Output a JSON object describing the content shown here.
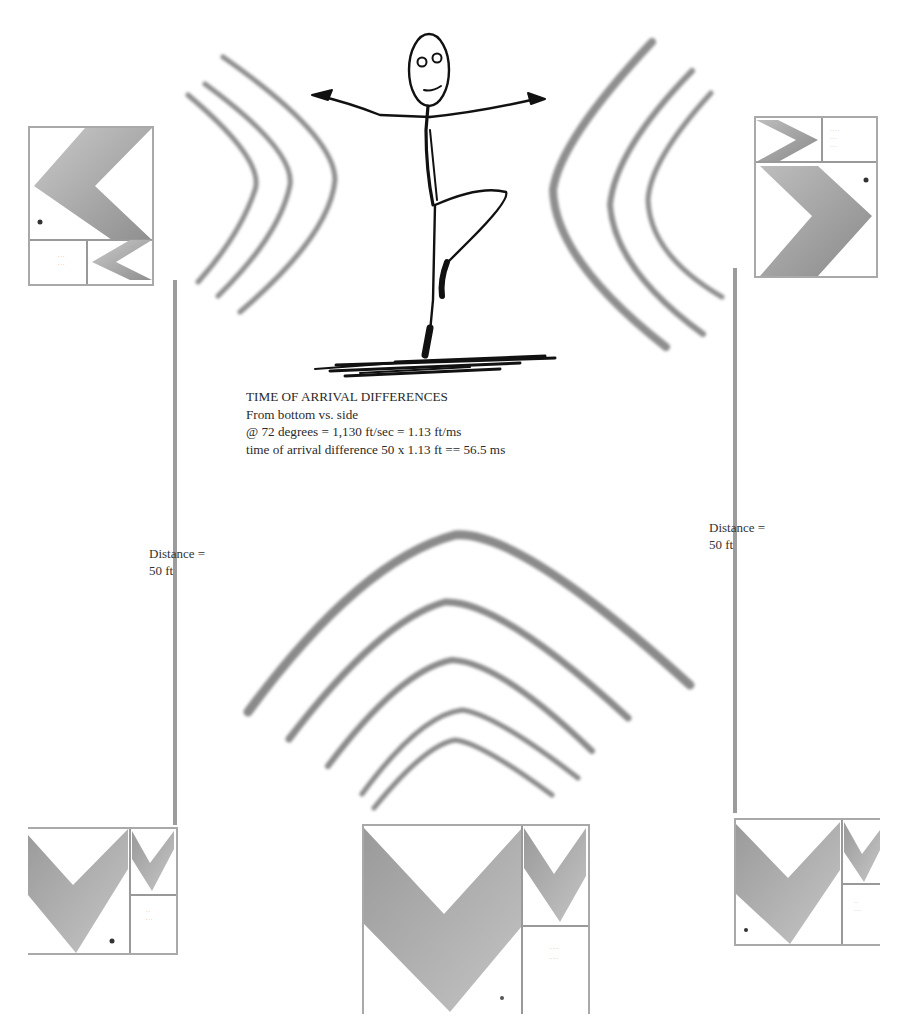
{
  "diagram": {
    "caption": {
      "title": "TIME OF ARRIVAL DIFFERENCES",
      "line1": "From bottom vs. side",
      "line2": "@ 72 degrees =  1,130 ft/sec = 1.13 ft/ms",
      "line3": "time of arrival difference 50 x 1.13 ft == 56.5 ms"
    },
    "left_distance": {
      "line1": "Distance =",
      "line2": "50 ft"
    },
    "right_distance": {
      "line1": "Distance =",
      "line2": "50 ft"
    },
    "figure": "stick-figure-dancer",
    "wave_groups": [
      {
        "position": "left",
        "direction": "right",
        "arcs": 3
      },
      {
        "position": "right",
        "direction": "left",
        "arcs": 3
      },
      {
        "position": "bottom",
        "direction": "up",
        "arcs": 5
      }
    ],
    "speakers": [
      {
        "position": "top-left"
      },
      {
        "position": "top-right"
      },
      {
        "position": "bottom-left"
      },
      {
        "position": "bottom-center"
      },
      {
        "position": "bottom-right"
      }
    ],
    "colors": {
      "wave": "#8c8c8c",
      "line": "#9a9a9a",
      "figure": "#111111",
      "chevron": "#a8a8a8"
    }
  }
}
